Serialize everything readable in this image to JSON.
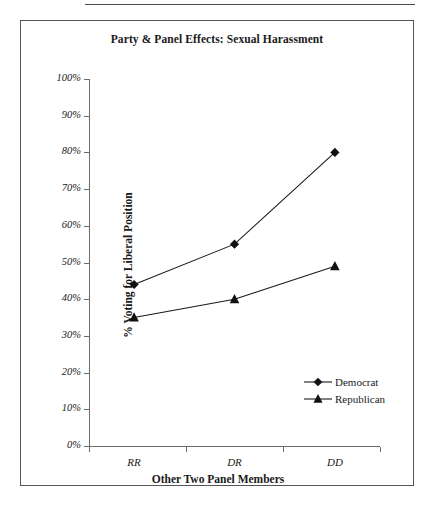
{
  "figure": {
    "title": "Party & Panel Effects: Sexual Harassment"
  },
  "chart_data": {
    "type": "line",
    "title": "Party & Panel Effects: Sexual Harassment",
    "xlabel": "Other Two Panel Members",
    "ylabel": "% Voting for Liberal Position",
    "categories": [
      "RR",
      "DR",
      "DD"
    ],
    "series": [
      {
        "name": "Democrat",
        "marker": "diamond",
        "values": [
          44,
          55,
          80
        ]
      },
      {
        "name": "Republican",
        "marker": "triangle",
        "values": [
          35,
          40,
          49
        ]
      }
    ],
    "ylim": [
      0,
      100
    ],
    "ytick_labels": [
      "0%",
      "10%",
      "20%",
      "30%",
      "40%",
      "50%",
      "60%",
      "70%",
      "80%",
      "90%",
      "100%"
    ],
    "ytick_values": [
      0,
      10,
      20,
      30,
      40,
      50,
      60,
      70,
      80,
      90,
      100
    ],
    "grid": false,
    "legend_position": "inside-lower-right",
    "line_color": "#1a1a1a",
    "marker_color": "#111111",
    "axis_color": "#6b6b6b"
  },
  "legend": {
    "entries": [
      {
        "label": "Democrat"
      },
      {
        "label": "Republican"
      }
    ]
  }
}
